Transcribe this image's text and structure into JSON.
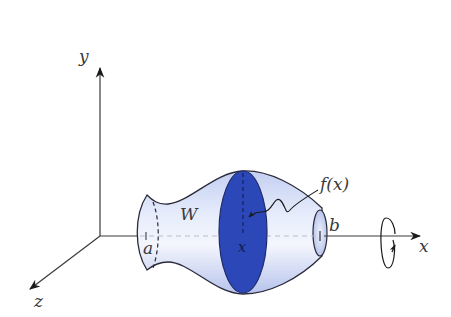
{
  "figure": {
    "axes": {
      "x_label": "x",
      "y_label": "y",
      "z_label": "z"
    },
    "labels": {
      "solid": "W",
      "left_bound": "a",
      "right_bound": "b",
      "cross_section_position": "x",
      "radius_function": "f(x)"
    },
    "colors": {
      "solid_fill_light": "#dfe6f8",
      "solid_fill_mid": "#b9c6ee",
      "cross_section": "#2c47b8",
      "outline": "#2a2a3a",
      "axis": "#3a3a3a",
      "background": "#ffffff"
    },
    "annotations": {
      "rotation_indicator": "rotation-about-x-axis"
    }
  }
}
